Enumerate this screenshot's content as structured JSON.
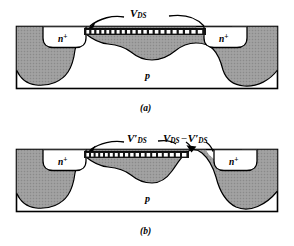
{
  "figure": {
    "kind": "semiconductor-cross-section",
    "panels": [
      {
        "id": "a",
        "caption": "(a)",
        "substrate_label": "p",
        "source_label": "n",
        "source_sup": "+",
        "drain_label": "n",
        "drain_sup": "+",
        "voltage_labels": [
          {
            "id": "vds-a",
            "symbol": "V",
            "subscript": "DS",
            "prime": "",
            "text": "V_DS"
          }
        ]
      },
      {
        "id": "b",
        "caption": "(b)",
        "substrate_label": "p",
        "source_label": "n",
        "source_sup": "+",
        "drain_label": "n",
        "drain_sup": "+",
        "voltage_labels": [
          {
            "id": "vds-prime-b",
            "symbol": "V",
            "subscript": "DS",
            "prime": "′",
            "text": "V'_DS"
          },
          {
            "id": "vds-diff-b",
            "symbol": "V",
            "subscript": "DS",
            "minus": "−",
            "symbol2": "V",
            "subscript2": "DS",
            "prime2": "′",
            "text": "V_DS - V'_DS"
          }
        ]
      }
    ],
    "colors": {
      "depletion_fill": "#9d9d9d",
      "outline": "#000000",
      "background": "#ffffff",
      "gate_bar": "#141414",
      "gate_dash": "#ffffff"
    }
  }
}
